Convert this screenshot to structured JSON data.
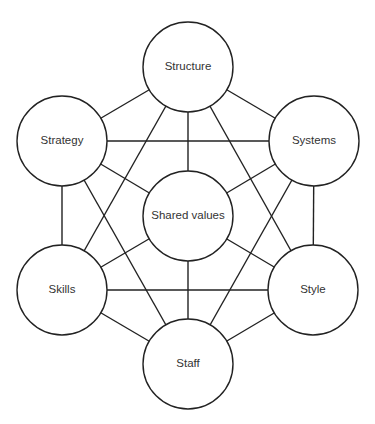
{
  "diagram": {
    "title": "",
    "nodes": [
      {
        "id": "structure",
        "label": "Structure",
        "x": 188,
        "y": 67
      },
      {
        "id": "strategy",
        "label": "Strategy",
        "x": 62,
        "y": 141
      },
      {
        "id": "systems",
        "label": "Systems",
        "x": 314,
        "y": 141
      },
      {
        "id": "shared",
        "label": "Shared values",
        "x": 188,
        "y": 216
      },
      {
        "id": "skills",
        "label": "Skills",
        "x": 62,
        "y": 290
      },
      {
        "id": "style",
        "label": "Style",
        "x": 313,
        "y": 290
      },
      {
        "id": "staff",
        "label": "Staff",
        "x": 188,
        "y": 364
      }
    ],
    "radius": 45,
    "edges": [
      [
        "structure",
        "strategy"
      ],
      [
        "structure",
        "systems"
      ],
      [
        "structure",
        "shared"
      ],
      [
        "structure",
        "skills"
      ],
      [
        "structure",
        "style"
      ],
      [
        "strategy",
        "systems"
      ],
      [
        "strategy",
        "shared"
      ],
      [
        "strategy",
        "skills"
      ],
      [
        "strategy",
        "staff"
      ],
      [
        "systems",
        "shared"
      ],
      [
        "systems",
        "style"
      ],
      [
        "systems",
        "staff"
      ],
      [
        "shared",
        "skills"
      ],
      [
        "shared",
        "style"
      ],
      [
        "shared",
        "staff"
      ],
      [
        "skills",
        "style"
      ],
      [
        "skills",
        "staff"
      ],
      [
        "style",
        "staff"
      ]
    ]
  }
}
